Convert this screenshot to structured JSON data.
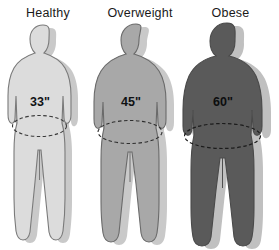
{
  "infographic": {
    "title_visible": false,
    "background_color": "#ffffff",
    "figures": [
      {
        "label": "Healthy",
        "waist_measurement": "33\"",
        "body_color": "#dcdcdc",
        "outline_color": "#7a7a7a",
        "shadow_color": "#c9c9c9",
        "measurement_text_color": "#101214",
        "ellipse_stroke": "#3a3a3a"
      },
      {
        "label": "Overweight",
        "waist_measurement": "45\"",
        "body_color": "#a8a8a8",
        "outline_color": "#6a6a6a",
        "shadow_color": "#c9c9c9",
        "measurement_text_color": "#0f1113",
        "ellipse_stroke": "#2e2e2e"
      },
      {
        "label": "Obese",
        "waist_measurement": "60\"",
        "body_color": "#5a5a5a",
        "outline_color": "#4a4a4a",
        "shadow_color": "#c0c0c0",
        "measurement_text_color": "#0c0d0e",
        "ellipse_stroke": "#1c1c1c"
      }
    ]
  }
}
